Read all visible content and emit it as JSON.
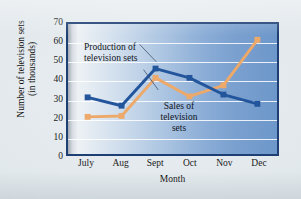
{
  "chart_data": {
    "type": "line",
    "title": "",
    "xlabel": "Month",
    "ylabel": "Number of television sets (in thousands)",
    "ylabel_line1": "Number of television sets",
    "ylabel_line2": "(in thousands)",
    "categories": [
      "July",
      "Aug",
      "Sept",
      "Oct",
      "Nov",
      "Dec"
    ],
    "yticks": [
      0,
      10,
      20,
      30,
      40,
      50,
      60,
      70
    ],
    "ylim": [
      0,
      70
    ],
    "grid": true,
    "legend_position": "in-plot-annotations",
    "series": [
      {
        "name": "Production of television sets",
        "color": "#23559c",
        "marker": "square",
        "values": [
          30.5,
          26,
          46,
          41,
          32,
          27
        ]
      },
      {
        "name": "Sales of television sets",
        "color": "#eda96a",
        "marker": "square",
        "values": [
          20,
          20.5,
          41,
          31,
          37,
          61.5
        ]
      }
    ],
    "annotations": [
      {
        "id": "production-annotation",
        "lines": [
          "Production of",
          "television sets"
        ],
        "text": "Production of television sets",
        "points_to": "Sept production point"
      },
      {
        "id": "sales-annotation",
        "lines": [
          "Sales of",
          "television",
          "sets"
        ],
        "text": "Sales of television sets",
        "points_to": "Sept sales point"
      }
    ],
    "colors": {
      "production": "#23559c",
      "sales": "#eda96a",
      "frame": "#1d3f73",
      "gridline": "#ffffff",
      "plot_background_left": "#f2f4f6",
      "plot_background_right": "#6d97ca",
      "page_background": "#e2e9ed"
    }
  }
}
